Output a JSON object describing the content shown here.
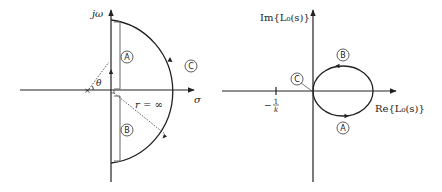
{
  "left_diagram": {
    "title": "s-plane Nyquist contour",
    "vertical_axis_label": "jω",
    "horizontal_axis_label": "σ",
    "angle_label": "θ",
    "radius_label": "r = ∞",
    "segments": {
      "A": "A",
      "B": "B",
      "C": "C"
    },
    "pole_marker": "×"
  },
  "right_diagram": {
    "title": "Nyquist plot of L0(s)",
    "vertical_axis_label": "Im{L₀(s)}",
    "horizontal_axis_label": "Re{L₀(s)}",
    "tick_label_minus": "−",
    "tick_label_num": "1",
    "tick_label_den": "k",
    "segments": {
      "A": "A",
      "B": "B",
      "C": "C"
    }
  },
  "colors": {
    "stroke": "#222222",
    "bracket": "#555555",
    "background": "#ffffff"
  }
}
